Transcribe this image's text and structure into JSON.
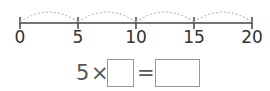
{
  "number_line": {
    "ticks": [
      {
        "value": "0",
        "x": 20
      },
      {
        "value": "5",
        "x": 78
      },
      {
        "value": "10",
        "x": 136
      },
      {
        "value": "15",
        "x": 194
      },
      {
        "value": "20",
        "x": 252
      }
    ],
    "jump": 5,
    "line_color": "#444444",
    "arc_color": "#bbbbbb"
  },
  "equation": {
    "multiplicand": "5",
    "times_sign": "×",
    "equals_sign": "=",
    "blank_1": "",
    "blank_2": ""
  }
}
